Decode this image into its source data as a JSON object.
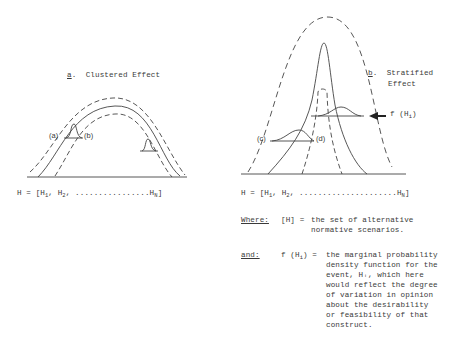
{
  "panel_a": {
    "letter": "a",
    "title": "Clustered Effect",
    "labels": {
      "a": "(a)",
      "b": "(b)"
    },
    "equation": {
      "lhs": "H = [H",
      "sub1": "1",
      "mid": ", H",
      "sub2": "2",
      "dots": ", ................",
      "last": "H",
      "subN": "N",
      "close": "]"
    }
  },
  "panel_b": {
    "letter": "b",
    "title_line1": "Stratified",
    "title_line2": "Effect",
    "labels": {
      "c": "(c)",
      "d": "(d)"
    },
    "arrow_label": {
      "text": "f (H",
      "sub": "i",
      "close": ")"
    },
    "equation": {
      "lhs": "H = [H",
      "sub1": "1",
      "mid": ", H",
      "sub2": "2",
      "dots": ", .....................",
      "last": "H",
      "subN": "N",
      "close": "]"
    }
  },
  "definitions": {
    "where": {
      "keyword": "Where:",
      "term": "[H] =",
      "lines": [
        "the set of alternative",
        "normative scenarios."
      ]
    },
    "and": {
      "keyword": "and:",
      "term_text": "f (H",
      "term_sub": "i",
      "term_close": ") =",
      "lines": [
        "the marginal probability",
        "density function for the",
        "event, Hᵢ, which here",
        "would reflect the degree",
        "of variation in opinion",
        "about the desirability",
        "or feasibility of that",
        "construct."
      ]
    }
  },
  "colors": {
    "ink": "#3a3a3a",
    "background": "#ffffff"
  }
}
